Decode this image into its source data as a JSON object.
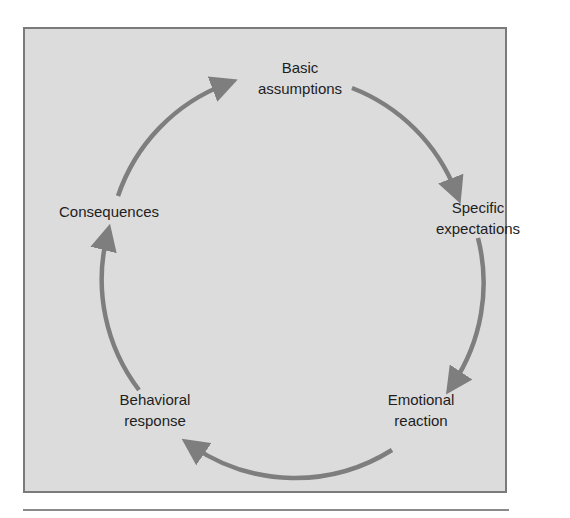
{
  "diagram": {
    "type": "cycle",
    "colors": {
      "background": "#dcdcdc",
      "border": "#7a7a7a",
      "arrow": "#7e7e7e",
      "text": "#1e1e1e"
    },
    "nodes": [
      {
        "id": "basic",
        "lines": [
          "Basic",
          "assumptions"
        ]
      },
      {
        "id": "specific",
        "lines": [
          "Specific",
          "expectations"
        ]
      },
      {
        "id": "emotional",
        "lines": [
          "Emotional",
          "reaction"
        ]
      },
      {
        "id": "behavioral",
        "lines": [
          "Behavioral",
          "response"
        ]
      },
      {
        "id": "consequences",
        "lines": [
          "Consequences"
        ]
      }
    ],
    "edges": [
      {
        "from": "basic",
        "to": "specific"
      },
      {
        "from": "specific",
        "to": "emotional"
      },
      {
        "from": "emotional",
        "to": "behavioral"
      },
      {
        "from": "behavioral",
        "to": "consequences"
      },
      {
        "from": "consequences",
        "to": "basic"
      }
    ]
  }
}
